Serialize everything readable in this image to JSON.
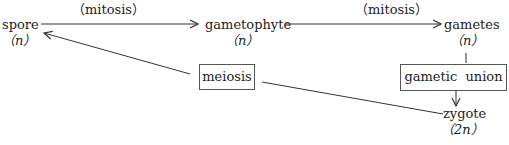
{
  "diagram": {
    "nodes": {
      "spore": {
        "label": "spore",
        "ploidy": "（n）"
      },
      "gametophyte": {
        "label": "gametophyte",
        "ploidy": "（n）"
      },
      "gametes": {
        "label": "gametes",
        "ploidy": "（n）"
      },
      "zygote": {
        "label": "zygote",
        "ploidy": "（2n）"
      }
    },
    "processes": {
      "mitosis_1": "（mitosis）",
      "mitosis_2": "（mitosis）",
      "meiosis": "meiosis",
      "gametic_union": "gametic  union"
    },
    "edges": [
      {
        "from": "spore",
        "to": "gametophyte",
        "label": "mitosis"
      },
      {
        "from": "gametophyte",
        "to": "gametes",
        "label": "mitosis"
      },
      {
        "from": "gametes",
        "to": "zygote",
        "label": "gametic union"
      },
      {
        "from": "zygote",
        "to": "spore",
        "label": "meiosis"
      }
    ],
    "colors": {
      "line": "#333333",
      "box_border": "#555555",
      "text": "#222222"
    }
  }
}
